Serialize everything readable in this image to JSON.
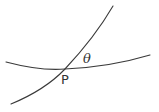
{
  "diagram": {
    "labels": {
      "point": "P",
      "angle": "θ"
    },
    "curves": [
      {
        "name": "flat-curve",
        "from": [
          6,
          62
        ],
        "via": [
          64,
          69
        ],
        "to": [
          150,
          55
        ]
      },
      {
        "name": "steep-curve",
        "from": [
          11,
          104
        ],
        "via": [
          65,
          69
        ],
        "to": [
          113,
          6
        ]
      }
    ],
    "intersection": [
      65,
      69
    ],
    "colors": {
      "stroke": "#3a3a3a",
      "text": "#333333",
      "background": "#ffffff"
    }
  }
}
